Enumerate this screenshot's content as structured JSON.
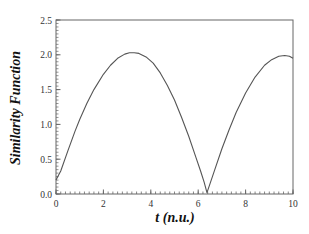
{
  "chart_data": {
    "type": "line",
    "title": "",
    "xlabel": "t (n.u.)",
    "ylabel": "Similarity Function",
    "xlim": [
      0,
      10
    ],
    "ylim": [
      0,
      2.5
    ],
    "xticks": [
      0,
      2,
      4,
      6,
      8,
      10
    ],
    "xtick_labels": [
      "0",
      "2",
      "4",
      "6",
      "8",
      "10"
    ],
    "yticks": [
      0.0,
      0.5,
      1.0,
      1.5,
      2.0,
      2.5
    ],
    "ytick_labels": [
      "0.0",
      "0.5",
      "1.0",
      "1.5",
      "2.0",
      "2.5"
    ],
    "x_minor_step": 0.2,
    "y_minor_step": 0.05,
    "grid": false,
    "legend": null,
    "line_color": "#555555",
    "series": [
      {
        "name": "Similarity Function",
        "x": [
          0,
          0.2,
          0.5,
          0.8,
          1.0,
          1.3,
          1.6,
          2.0,
          2.3,
          2.6,
          2.9,
          3.1,
          3.3,
          3.5,
          3.8,
          4.1,
          4.4,
          4.7,
          5.0,
          5.3,
          5.6,
          5.9,
          6.1,
          6.25,
          6.37,
          6.5,
          6.7,
          7.0,
          7.3,
          7.6,
          8.0,
          8.4,
          8.8,
          9.1,
          9.4,
          9.65,
          9.85,
          10.0
        ],
        "y": [
          0.2,
          0.33,
          0.62,
          0.9,
          1.07,
          1.3,
          1.5,
          1.72,
          1.85,
          1.95,
          2.01,
          2.03,
          2.03,
          2.02,
          1.97,
          1.88,
          1.74,
          1.56,
          1.35,
          1.1,
          0.83,
          0.53,
          0.33,
          0.17,
          0.02,
          0.15,
          0.35,
          0.65,
          0.92,
          1.17,
          1.45,
          1.68,
          1.85,
          1.93,
          1.98,
          1.99,
          1.98,
          1.95
        ]
      }
    ]
  }
}
